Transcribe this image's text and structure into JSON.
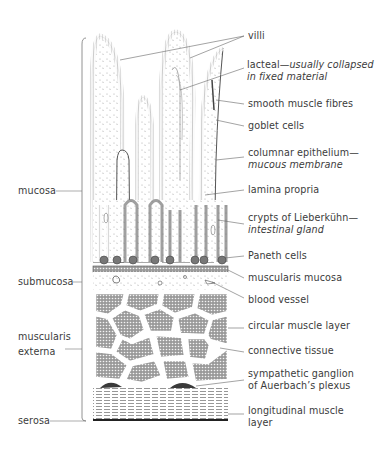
{
  "colors": {
    "ink": "#3a3a3a",
    "leader": "#555555",
    "background": "#ffffff"
  },
  "left_labels": [
    {
      "id": "mucosa",
      "text": "mucosa"
    },
    {
      "id": "submucosa",
      "text": "submucosa"
    },
    {
      "id": "muscularis-externa",
      "line1": "muscularis",
      "line2": "externa"
    },
    {
      "id": "serosa",
      "text": "serosa"
    }
  ],
  "right_labels": [
    {
      "id": "villi",
      "text": "villi"
    },
    {
      "id": "lacteal",
      "text": "lacteal",
      "note_line1": "usually collapsed",
      "note_line2": "in fixed material"
    },
    {
      "id": "smooth-muscle-fibres",
      "text": "smooth muscle fibres"
    },
    {
      "id": "goblet-cells",
      "text": "goblet cells"
    },
    {
      "id": "columnar-epithelium",
      "text": "columnar epithelium—",
      "note": "mucous membrane"
    },
    {
      "id": "lamina-propria",
      "text": "lamina propria"
    },
    {
      "id": "crypts-of-lieberkuhn",
      "text": "crypts of Lieberkühn—",
      "note": "intestinal gland"
    },
    {
      "id": "paneth-cells",
      "text": "Paneth cells"
    },
    {
      "id": "muscularis-mucosa",
      "text": "muscularis mucosa"
    },
    {
      "id": "blood-vessel",
      "text": "blood vessel"
    },
    {
      "id": "circular-muscle-layer",
      "text": "circular muscle layer"
    },
    {
      "id": "connective-tissue",
      "text": "connective tissue"
    },
    {
      "id": "sympathetic-ganglion",
      "line1": "sympathetic ganglion",
      "line2": "of Auerbach’s plexus"
    },
    {
      "id": "longitudinal-muscle-layer",
      "line1": "longitudinal muscle",
      "line2": "layer"
    }
  ],
  "dash": "—"
}
